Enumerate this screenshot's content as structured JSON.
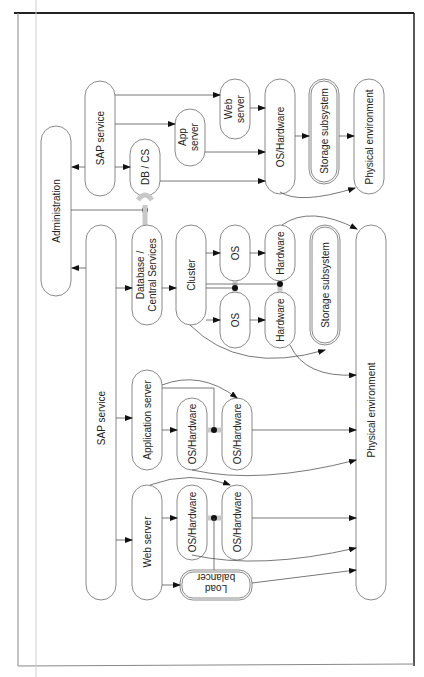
{
  "diagram": {
    "orientation": "rotated 90deg counter-clockwise",
    "top_section": {
      "nodes": {
        "administration": "Administration",
        "sap_service": "SAP service",
        "db_cs": "DB / CS",
        "app_server": "App server",
        "app_server_l1": "App",
        "app_server_l2": "server",
        "web_server_l1": "Web",
        "web_server_l2": "server",
        "os_hardware": "OS/Hardware",
        "storage_subsystem": "Storage subsystem",
        "physical_environment": "Physical environment"
      }
    },
    "bottom_section": {
      "nodes": {
        "sap_service": "SAP service",
        "database_l1": "Database /",
        "database_l2": "Central Services",
        "cluster": "Cluster",
        "os_1": "OS",
        "os_2": "OS",
        "hardware_1": "Hardware",
        "hardware_2": "Hardware",
        "storage_subsystem": "Storage subsystem",
        "application_server": "Application server",
        "app_os_hw_1": "OS/Hardware",
        "app_os_hw_2": "OS/Hardware",
        "web_server": "Web server",
        "web_os_hw_1": "OS/Hardware",
        "web_os_hw_2": "OS/Hardware",
        "load_balancer_l1": "Load",
        "load_balancer_l2": "balancer",
        "physical_environment": "Physical environment"
      }
    }
  }
}
